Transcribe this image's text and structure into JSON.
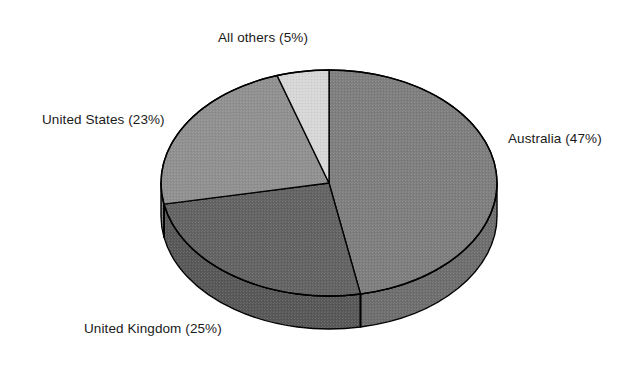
{
  "chart_data": {
    "type": "pie",
    "title": "",
    "subtitle": "",
    "xlabel": "",
    "ylabel": "",
    "legend_position": "none",
    "grid": false,
    "three_d": true,
    "start_angle_deg": 90,
    "direction": "clockwise",
    "categories": [
      "Australia",
      "United Kingdom",
      "United States",
      "All others"
    ],
    "values": [
      47,
      25,
      23,
      5
    ],
    "units": "percent",
    "slices": [
      {
        "name": "Australia",
        "value": 47,
        "label": "Australia (47%)",
        "percent_text": "47%",
        "color": "#7e7e7e",
        "side_color": "#6e6e6e"
      },
      {
        "name": "United Kingdom",
        "value": 25,
        "label": "United Kingdom (25%)",
        "percent_text": "25%",
        "color": "#636363",
        "side_color": "#585858"
      },
      {
        "name": "United States",
        "value": 23,
        "label": "United States (23%)",
        "percent_text": "23%",
        "color": "#909090",
        "side_color": "#7d7d7d"
      },
      {
        "name": "All others",
        "value": 5,
        "label": "All others (5%)",
        "percent_text": "5%",
        "color": "#d7d7d7",
        "side_color": "#bcbcbc"
      }
    ],
    "colors": {
      "background": "#ffffff",
      "outline": "#000000",
      "text": "#1a1a1a"
    }
  },
  "labels": {
    "all_others": "All others (5%)",
    "united_states": "United States (23%)",
    "australia": "Australia (47%)",
    "united_kingdom": "United Kingdom (25%)"
  }
}
